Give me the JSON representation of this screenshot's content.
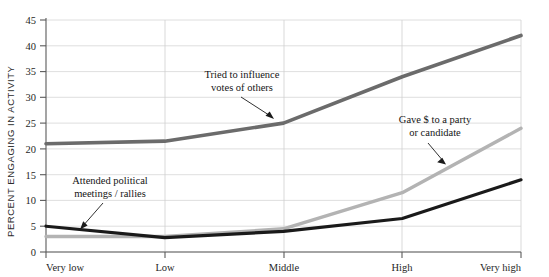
{
  "chart_data": {
    "type": "line",
    "title": "",
    "xlabel": "",
    "ylabel": "PERCENT ENGAGING IN ACTIVITY",
    "categories": [
      "Very low",
      "Low",
      "Middle",
      "High",
      "Very high"
    ],
    "ylim": [
      0,
      45
    ],
    "ytick_step": 5,
    "ytick_labels": [
      "0",
      "5",
      "10",
      "15",
      "20",
      "25",
      "30",
      "35",
      "40",
      "45"
    ],
    "grid": "horizontal",
    "legend": "none (inline annotations with arrows)",
    "series": [
      {
        "name": "Tried to influence votes of others",
        "color": "#6b6b6b",
        "values": [
          21,
          21.5,
          25,
          34,
          42
        ]
      },
      {
        "name": "Gave $ to a party or candidate",
        "color": "#b3b3b3",
        "values": [
          3,
          3,
          4.5,
          11.5,
          24
        ]
      },
      {
        "name": "Attended political meetings/rallies",
        "color": "#1a1a1a",
        "values": [
          5,
          2.8,
          4,
          6.5,
          14
        ]
      }
    ],
    "annotations": [
      {
        "id": "influence",
        "line1": "Tried to influence",
        "line2": "votes of others",
        "target_series": "Tried to influence votes of others"
      },
      {
        "id": "gave-money",
        "line1": "Gave $ to a party",
        "line2": "or candidate",
        "target_series": "Gave $ to a party or candidate"
      },
      {
        "id": "meetings",
        "line1": "Attended political",
        "line2": "meetings / rallies",
        "target_series": "Attended political meetings/rallies"
      }
    ]
  }
}
